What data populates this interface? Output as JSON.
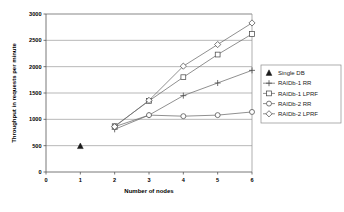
{
  "chart_data": {
    "type": "line",
    "title": "",
    "xlabel": "Number of nodes",
    "ylabel": "Throughput in requests per minute",
    "xlim": [
      0,
      6
    ],
    "ylim": [
      0,
      3000
    ],
    "xticks": [
      "0",
      "1",
      "2",
      "3",
      "4",
      "5",
      "6"
    ],
    "yticks": [
      "0",
      "500",
      "1000",
      "1500",
      "2000",
      "2500",
      "3000"
    ],
    "grid": "horizontal",
    "legend_position": "right",
    "series": [
      {
        "name": "Single DB",
        "marker": "filled-triangle",
        "x": [
          1
        ],
        "values": [
          490
        ]
      },
      {
        "name": "RAIDb-1 RR",
        "marker": "plus",
        "x": [
          2,
          3,
          4,
          5,
          6
        ],
        "values": [
          810,
          1080,
          1450,
          1690,
          1930
        ]
      },
      {
        "name": "RAIDb-1 LPRF",
        "marker": "open-square",
        "x": [
          2,
          3,
          4,
          5,
          6
        ],
        "values": [
          870,
          1350,
          1800,
          2230,
          2620
        ]
      },
      {
        "name": "RAIDb-2 RR",
        "marker": "open-circle",
        "x": [
          2,
          3,
          4,
          5,
          6
        ],
        "values": [
          860,
          1080,
          1060,
          1080,
          1140
        ]
      },
      {
        "name": "RAIDb-2 LPRF",
        "marker": "open-diamond",
        "x": [
          2,
          3,
          4,
          5,
          6
        ],
        "values": [
          860,
          1360,
          2010,
          2420,
          2830
        ]
      }
    ]
  },
  "legend": {
    "items": [
      {
        "label": "Single DB",
        "marker": "filled-triangle"
      },
      {
        "label": "RAIDb-1 RR",
        "marker": "plus"
      },
      {
        "label": "RAIDb-1 LPRF",
        "marker": "open-square"
      },
      {
        "label": "RAIDb-2 RR",
        "marker": "open-circle"
      },
      {
        "label": "RAIDb-2 LPRF",
        "marker": "open-diamond"
      }
    ]
  },
  "colors": {
    "background": "#ffffff",
    "grid": "#9a9a9a",
    "axis": "#555555",
    "series_line": "#6b6b6b",
    "marker_fill": "#ffffff",
    "marker_stroke": "#4d4d4d",
    "text": "#000000"
  }
}
